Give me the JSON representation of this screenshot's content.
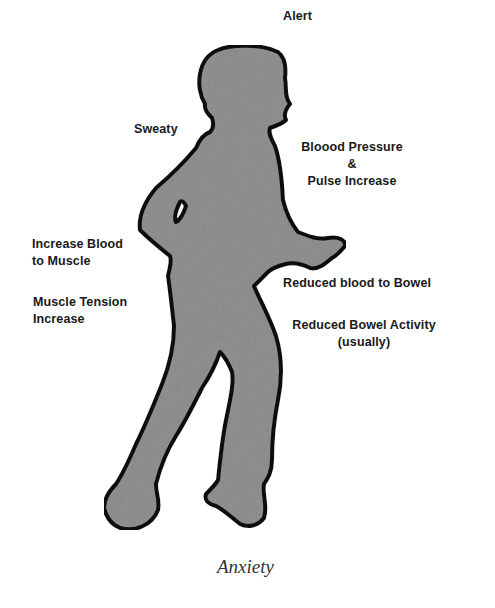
{
  "diagram": {
    "title": "Anxiety",
    "figure": "running-person-silhouette",
    "colors": {
      "body_fill": "#9a9a9a",
      "body_outline": "#111111",
      "label_text": "#1a1a1a",
      "caption_text": "#333333",
      "background": "#ffffff"
    },
    "labels": {
      "alert": "Alert",
      "sweaty": "Sweaty",
      "blood_pressure_line1": "Bloood Pressure",
      "blood_pressure_line2": "&",
      "blood_pressure_line3": "Pulse Increase",
      "increase_blood_line1": "Increase Blood",
      "increase_blood_line2": "to Muscle",
      "muscle_tension_line1": "Muscle Tension",
      "muscle_tension_line2": "Increase",
      "reduced_blood_bowel": "Reduced blood to Bowel",
      "reduced_bowel_activity_line1": "Reduced Bowel Activity",
      "reduced_bowel_activity_line2": "(usually)"
    },
    "caption": "Anxiety"
  }
}
